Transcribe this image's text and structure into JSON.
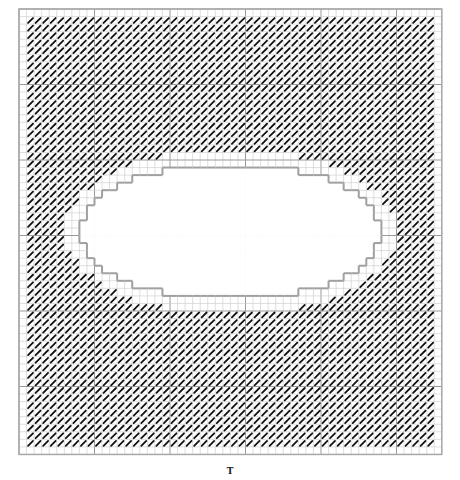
{
  "diagram": {
    "type": "stitch-chart",
    "grid": {
      "origin_x": 19,
      "origin_y": 9,
      "cell": 7.55,
      "cols": 56,
      "rows": 59,
      "major_every": 10,
      "minor_color": "#c9c9c9",
      "major_color": "#9a9a9a",
      "border_color": "#a8a8a8"
    },
    "stitch": {
      "symbol": "diagonal-slash",
      "color": "#111111",
      "border_margin_cells": 1
    },
    "hole": {
      "shape": "stepped-ellipse",
      "center_col": 28,
      "center_row": 29.5,
      "radius_cols": 20,
      "radius_rows": 9,
      "outline_color": "#a0a0a0",
      "empty_ring_cells": 2
    }
  },
  "caption": "T"
}
